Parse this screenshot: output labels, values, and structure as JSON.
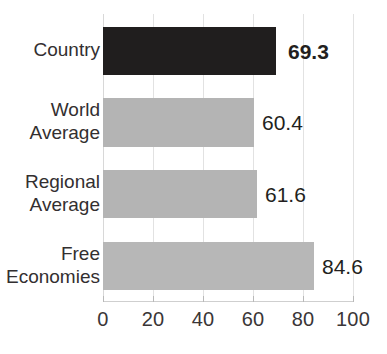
{
  "chart_data": {
    "type": "bar",
    "orientation": "horizontal",
    "title": "",
    "xlabel": "",
    "ylabel": "",
    "categories": [
      "Country",
      "World\nAverage",
      "Regional\nAverage",
      "Free\nEconomies"
    ],
    "values": [
      69.3,
      60.4,
      61.6,
      84.6
    ],
    "value_labels": [
      "69.3",
      "60.4",
      "61.6",
      "84.6"
    ],
    "bar_colors": [
      "#201e1e",
      "#b4b4b4",
      "#b4b4b4",
      "#b7b7b7"
    ],
    "highlight_index": 0,
    "xlim": [
      0,
      100
    ],
    "xticks": [
      0,
      20,
      40,
      60,
      80,
      100
    ],
    "xtick_labels": [
      "0",
      "20",
      "40",
      "60",
      "80",
      "100"
    ],
    "grid": true,
    "grid_axis": "x",
    "legend": null,
    "legend_position": "none",
    "colors": {
      "highlight_bar": "#201e1e",
      "default_bar": "#b4b4b4",
      "gridline": "#e2e2e2",
      "axis": "#cfcfcf",
      "text": "#231f20",
      "background": "#ffffff"
    }
  },
  "axis_geometry": {
    "x_origin_px": 103,
    "x_end_px": 353,
    "px_per_unit": 2.5,
    "plot_top_px": 14,
    "plot_bottom_px": 301
  },
  "rows": [
    {
      "label": "Country",
      "value_label": "69.3",
      "bar_top": 27,
      "bar_height": 48,
      "bar_width": 173,
      "label_top": 38,
      "value_left": 288,
      "value_top": 40,
      "bold": true,
      "color": "#201e1e"
    },
    {
      "label": "World\nAverage",
      "value_label": "60.4",
      "bar_top": 98,
      "bar_height": 49,
      "bar_width": 151,
      "label_top": 98,
      "value_left": 262,
      "value_top": 111,
      "bold": false,
      "color": "#b4b4b4"
    },
    {
      "label": "Regional\nAverage",
      "value_label": "61.6",
      "bar_top": 170,
      "bar_height": 48,
      "bar_width": 154,
      "label_top": 170,
      "value_left": 265,
      "value_top": 183,
      "bold": false,
      "color": "#b4b4b4"
    },
    {
      "label": "Free\nEconomies",
      "value_label": "84.6",
      "bar_top": 242,
      "bar_height": 48,
      "bar_width": 211,
      "label_top": 242,
      "value_left": 322,
      "value_top": 255,
      "bold": false,
      "color": "#b7b7b7"
    }
  ],
  "gridlines": [
    {
      "x": 103,
      "top": 14,
      "height": 287,
      "origin": true
    },
    {
      "x": 153,
      "top": 14,
      "height": 287,
      "origin": false
    },
    {
      "x": 203,
      "top": 14,
      "height": 287,
      "origin": false
    },
    {
      "x": 253,
      "top": 14,
      "height": 287,
      "origin": false
    },
    {
      "x": 303,
      "top": 14,
      "height": 287,
      "origin": false
    },
    {
      "x": 353,
      "top": 14,
      "height": 287,
      "origin": false
    }
  ],
  "ticks": [
    {
      "x": 103,
      "label": "0"
    },
    {
      "x": 153,
      "label": "20"
    },
    {
      "x": 203,
      "label": "40"
    },
    {
      "x": 253,
      "label": "60"
    },
    {
      "x": 303,
      "label": "80"
    },
    {
      "x": 353,
      "label": "100"
    }
  ]
}
